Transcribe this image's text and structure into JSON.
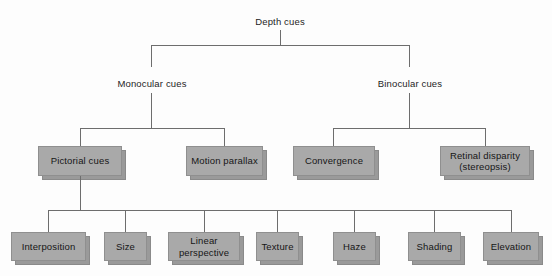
{
  "diagram": {
    "title": "Depth cues",
    "type": "hierarchy-tree",
    "background_color": "#fdfdfd",
    "box_fill_color": "#a9a9a9",
    "box_border_color": "#8f8f8f",
    "connector_color": "#6d6d6d",
    "text_color": "#1d1d1d"
  },
  "levels": {
    "root": {
      "label": "Depth cues"
    },
    "level2": [
      {
        "label": "Monocular cues"
      },
      {
        "label": "Binocular cues"
      }
    ],
    "level3": [
      {
        "label": "Pictorial cues"
      },
      {
        "label": "Motion parallax"
      },
      {
        "label": "Convergence"
      },
      {
        "label_line1": "Retinal disparity",
        "label_line2": "(stereopsis)"
      }
    ],
    "level4": [
      {
        "label": "Interposition"
      },
      {
        "label": "Size"
      },
      {
        "label_line1": "Linear",
        "label_line2": "perspective"
      },
      {
        "label": "Texture"
      },
      {
        "label": "Haze"
      },
      {
        "label": "Shading"
      },
      {
        "label": "Elevation"
      }
    ]
  }
}
